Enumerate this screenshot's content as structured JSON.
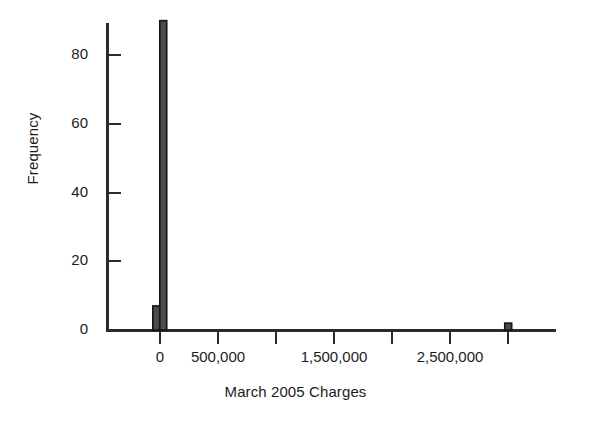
{
  "chart_data": {
    "type": "bar",
    "title": "",
    "subtitle": "",
    "xlabel": "March 2005 Charges",
    "ylabel": "Frequency",
    "xlim": [
      -180000,
      3400000
    ],
    "ylim": [
      0,
      93
    ],
    "grid": false,
    "legend": null,
    "bar_color": "#4b4b4b",
    "bar_edge_color": "#151515",
    "axis_color": "#2b2b2b",
    "background": "#ffffff",
    "x_tick_values": [
      0,
      500000,
      1000000,
      1500000,
      2000000,
      2500000,
      3000000
    ],
    "x_tick_labels": [
      "0",
      "500,000",
      "",
      "1,500,000",
      "",
      "2,500,000",
      ""
    ],
    "y_tick_values": [
      0,
      20,
      40,
      60,
      80
    ],
    "y_tick_labels": [
      "0",
      "20",
      "40",
      "60",
      "80"
    ],
    "bin_width": 60000,
    "categories": [
      "-60000",
      "0",
      "3000000"
    ],
    "values": [
      7,
      90,
      2
    ],
    "bars": [
      {
        "x_left": -62000,
        "x_right": -2000,
        "value": 7,
        "label": "bin-near-zero-low"
      },
      {
        "x_left": -2000,
        "x_right": 58000,
        "value": 90,
        "label": "bin-zero"
      },
      {
        "x_left": 2972000,
        "x_right": 3032000,
        "value": 2,
        "label": "bin-outlier-3m"
      }
    ],
    "annotations": []
  },
  "figure": {
    "name": "March 2005 Charges histogram",
    "axis_label_x": "March 2005 Charges",
    "axis_label_y": "Frequency"
  }
}
